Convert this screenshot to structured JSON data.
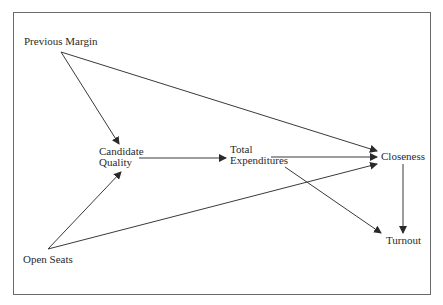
{
  "figure": {
    "title_fragment": "g",
    "nodes": {
      "previous_margin": {
        "label": "Previous Margin"
      },
      "candidate_quality": {
        "line1": "Candidate",
        "line2": "Quality"
      },
      "total_expenditures": {
        "line1": "Total",
        "line2": "Expenditures"
      },
      "closeness": {
        "label": "Closeness"
      },
      "turnout": {
        "label": "Turnout"
      },
      "open_seats": {
        "label": "Open Seats"
      }
    },
    "edges": [
      {
        "from": "Previous Margin",
        "to": "Candidate Quality"
      },
      {
        "from": "Previous Margin",
        "to": "Closeness"
      },
      {
        "from": "Open Seats",
        "to": "Candidate Quality"
      },
      {
        "from": "Open Seats",
        "to": "Closeness"
      },
      {
        "from": "Candidate Quality",
        "to": "Total Expenditures"
      },
      {
        "from": "Total Expenditures",
        "to": "Closeness"
      },
      {
        "from": "Total Expenditures",
        "to": "Turnout"
      },
      {
        "from": "Closeness",
        "to": "Turnout"
      }
    ],
    "colors": {
      "line": "#3a3a3a",
      "text": "#2a2a2a",
      "frame": "#6a6a6a"
    }
  }
}
